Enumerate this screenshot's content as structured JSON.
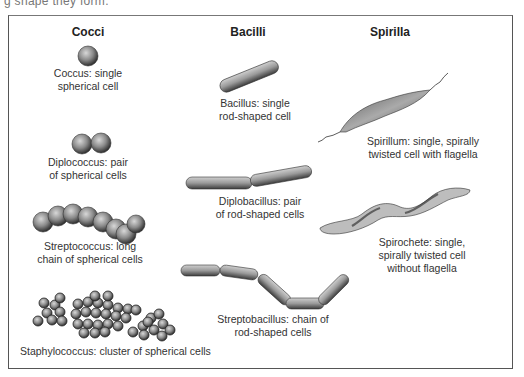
{
  "page": {
    "clipped_intro_text": "g shape they form."
  },
  "diagram": {
    "columns": [
      {
        "header": "Cocci"
      },
      {
        "header": "Bacilli"
      },
      {
        "header": "Spirilla"
      }
    ],
    "cocci": {
      "coccus": {
        "line1": "Coccus: single",
        "line2": "spherical cell"
      },
      "diplococcus": {
        "line1": "Diplococcus: pair",
        "line2": "of spherical cells"
      },
      "streptococcus": {
        "line1": "Streptococcus: long",
        "line2": "chain of spherical cells"
      },
      "staphylococcus": {
        "line1": "Staphylococcus: cluster of spherical cells"
      }
    },
    "bacilli": {
      "bacillus": {
        "line1": "Bacillus: single",
        "line2": "rod-shaped cell"
      },
      "diplobacillus": {
        "line1": "Diplobacillus: pair",
        "line2": "of rod-shaped cells"
      },
      "streptobacillus": {
        "line1": "Streptobacillus: chain of",
        "line2": "rod-shaped cells"
      }
    },
    "spirilla": {
      "spirillum": {
        "line1": "Spirillum: single, spirally",
        "line2": "twisted cell with flagella"
      },
      "spirochete": {
        "line1": "Spirochete: single,",
        "line2": "spirally twisted cell",
        "line3": "without flagella"
      }
    },
    "colors": {
      "border": "#555555",
      "cell_fill": "#8a8a8a",
      "cell_dark": "#3a3a3a",
      "text": "#333333"
    }
  }
}
